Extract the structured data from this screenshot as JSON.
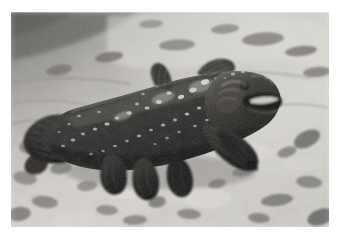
{
  "image": {
    "kind": "photograph",
    "medium": "underwater-photograph",
    "color_mode": "grayscale",
    "border_color": "#ffffff",
    "frame": {
      "x": 11,
      "y": 12,
      "width": 318,
      "height": 215
    },
    "caption": "",
    "subject": "coelacanth",
    "scene": "coelacanth resting above a pale sandy and pebbly sea floor",
    "palette": {
      "sand_light": "#d8d6d1",
      "sand_mid": "#b5b2ac",
      "sand_shadow": "#8e8b86",
      "rock_dark": "#5e5c59",
      "water_dark": "#6f6d6a",
      "fish_body": "#232321",
      "fish_body_mid": "#3b3a37",
      "fish_highlight": "#e8e6e1",
      "fish_spot": "#efeee9"
    },
    "regions": [
      {
        "name": "upper-left-water-shadow",
        "tone": "dark",
        "x": 0,
        "y": 0,
        "width": 120,
        "height": 60
      },
      {
        "name": "upper-sand-bank",
        "tone": "light",
        "x": 90,
        "y": 0,
        "width": 228,
        "height": 70
      },
      {
        "name": "mid-sand-floor",
        "tone": "mid",
        "x": 0,
        "y": 60,
        "width": 318,
        "height": 80
      },
      {
        "name": "lower-pebble-floor",
        "tone": "light",
        "x": 0,
        "y": 130,
        "width": 318,
        "height": 85
      }
    ],
    "fish": {
      "name": "coelacanth",
      "orientation": "facing-right",
      "bounding_box": {
        "x": 20,
        "y": 50,
        "width": 250,
        "height": 125
      },
      "parts": [
        {
          "name": "head",
          "label": "head-and-jaw"
        },
        {
          "name": "mouth",
          "label": "open-mouth-highlight"
        },
        {
          "name": "eye",
          "label": "eye"
        },
        {
          "name": "operculum",
          "label": "gill-cover-plate"
        },
        {
          "name": "first-dorsal-fin",
          "label": "first-dorsal-fin"
        },
        {
          "name": "second-dorsal-fin",
          "label": "second-dorsal-fin"
        },
        {
          "name": "pectoral-fin",
          "label": "lobed-pectoral-fin"
        },
        {
          "name": "pelvic-fin",
          "label": "lobed-pelvic-fin"
        },
        {
          "name": "anal-fin",
          "label": "lobed-anal-fin"
        },
        {
          "name": "caudal-fin",
          "label": "three-lobed-caudal-fin"
        },
        {
          "name": "body-spots",
          "label": "white-body-flecking"
        }
      ]
    },
    "seabed_objects": [
      {
        "name": "rock",
        "x": 232,
        "y": 22,
        "width": 40,
        "height": 13
      },
      {
        "name": "rock",
        "x": 276,
        "y": 34,
        "width": 30,
        "height": 10
      },
      {
        "name": "rock",
        "x": 150,
        "y": 28,
        "width": 34,
        "height": 11
      },
      {
        "name": "rock",
        "x": 84,
        "y": 40,
        "width": 26,
        "height": 9
      },
      {
        "name": "rock",
        "x": 10,
        "y": 125,
        "width": 28,
        "height": 16
      },
      {
        "name": "rock",
        "x": 38,
        "y": 150,
        "width": 24,
        "height": 12
      },
      {
        "name": "rock",
        "x": 280,
        "y": 120,
        "width": 26,
        "height": 14
      },
      {
        "name": "rock",
        "x": 252,
        "y": 182,
        "width": 34,
        "height": 12
      },
      {
        "name": "pebble",
        "x": 140,
        "y": 186,
        "width": 16,
        "height": 10
      },
      {
        "name": "pebble",
        "x": 196,
        "y": 168,
        "width": 14,
        "height": 9
      },
      {
        "name": "pebble",
        "x": 60,
        "y": 196,
        "width": 18,
        "height": 9
      }
    ]
  }
}
